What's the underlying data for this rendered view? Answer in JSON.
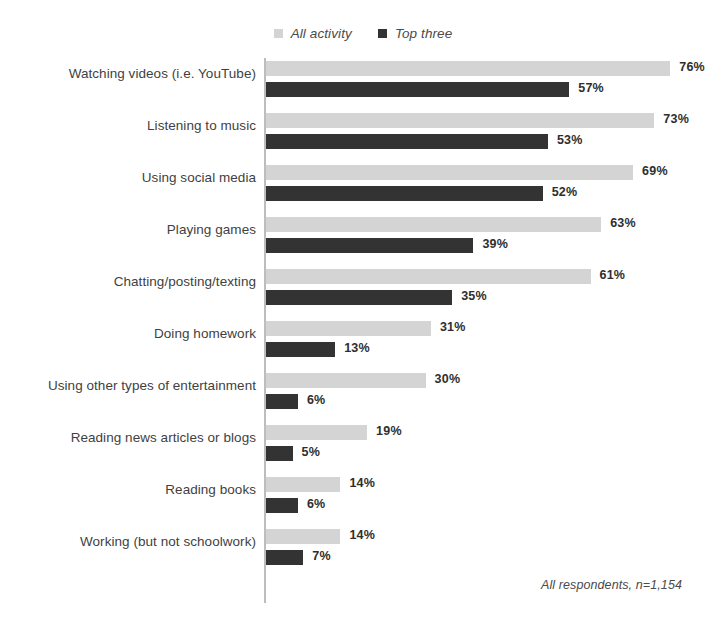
{
  "legend": {
    "position": "top-center",
    "items": [
      {
        "label": "All activity",
        "color": "#d4d4d4",
        "key": "all"
      },
      {
        "label": "Top three",
        "color": "#333333",
        "key": "top3"
      }
    ]
  },
  "footnote": "All respondents, n=1,154",
  "chart_data": {
    "type": "bar",
    "orientation": "horizontal",
    "title": "",
    "subtitle": "",
    "xlabel": "",
    "ylabel": "",
    "xlim": [
      0,
      80
    ],
    "grid": false,
    "legend_position": "top-center",
    "value_suffix": "%",
    "annotations": [
      "All respondents, n=1,154"
    ],
    "categories": [
      "Watching videos (i.e. YouTube)",
      "Listening to music",
      "Using social media",
      "Playing games",
      "Chatting/posting/texting",
      "Doing homework",
      "Using other types of entertainment",
      "Reading news articles or blogs",
      "Reading books",
      "Working (but not schoolwork)"
    ],
    "series": [
      {
        "name": "All activity",
        "color": "#d4d4d4",
        "values": [
          76,
          73,
          69,
          63,
          61,
          31,
          30,
          19,
          14,
          14
        ],
        "labels": [
          "76%",
          "73%",
          "69%",
          "63%",
          "61%",
          "31%",
          "30%",
          "19%",
          "14%",
          "14%"
        ]
      },
      {
        "name": "Top three",
        "color": "#333333",
        "values": [
          57,
          53,
          52,
          39,
          35,
          13,
          6,
          5,
          6,
          7
        ],
        "labels": [
          "57%",
          "53%",
          "52%",
          "39%",
          "35%",
          "13%",
          "6%",
          "5%",
          "6%",
          "7%"
        ]
      }
    ]
  }
}
